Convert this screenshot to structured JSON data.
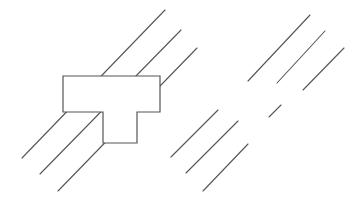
{
  "figure": {
    "width": 359,
    "height": 207,
    "background_color": "#ffffff",
    "stroke_color": "#555555",
    "shape_fill_color": "#ffffff",
    "shape_stroke_width": 1.2,
    "line_stroke_width": 1.1
  },
  "shapes": {
    "t_shape": {
      "name": "t-shape-polygon",
      "fill": "#ffffff",
      "stroke": "#555555",
      "points": "63,76 160,76 160,112 137,112 137,143 103,143 103,112 63,112"
    }
  },
  "line_groups": [
    {
      "name": "left-hatch-group",
      "count": 3,
      "lines": [
        {
          "name": "left-hatch-line-1",
          "x1": 22,
          "y1": 158,
          "x2": 165,
          "y2": 10
        },
        {
          "name": "left-hatch-line-2",
          "x1": 40,
          "y1": 174,
          "x2": 181,
          "y2": 30
        },
        {
          "name": "left-hatch-line-3",
          "x1": 58,
          "y1": 191,
          "x2": 197,
          "y2": 48
        }
      ]
    },
    {
      "name": "right-upper-hatch-group",
      "count": 3,
      "lines": [
        {
          "name": "right-upper-hatch-line-1",
          "x1": 248,
          "y1": 81,
          "x2": 310,
          "y2": 15
        },
        {
          "name": "right-upper-hatch-line-2",
          "x1": 277,
          "y1": 83,
          "x2": 325,
          "y2": 31
        },
        {
          "name": "right-upper-hatch-line-3",
          "x1": 303,
          "y1": 90,
          "x2": 344,
          "y2": 48
        }
      ]
    },
    {
      "name": "right-lower-hatch-group",
      "count": 3,
      "lines": [
        {
          "name": "right-lower-hatch-line-1",
          "x1": 171,
          "y1": 157,
          "x2": 218,
          "y2": 110
        },
        {
          "name": "right-lower-hatch-line-2",
          "x1": 186,
          "y1": 173,
          "x2": 238,
          "y2": 121
        },
        {
          "name": "right-lower-hatch-line-3",
          "x1": 203,
          "y1": 191,
          "x2": 248,
          "y2": 144
        }
      ]
    },
    {
      "name": "center-stub-group",
      "count": 1,
      "lines": [
        {
          "name": "center-stub-line-1",
          "x1": 269,
          "y1": 117,
          "x2": 281,
          "y2": 105
        }
      ]
    }
  ]
}
